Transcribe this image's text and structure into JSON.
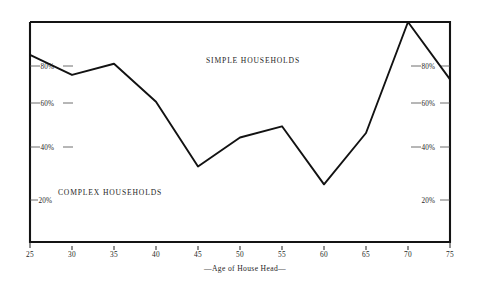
{
  "chart_data": {
    "type": "line",
    "title": "",
    "xlabel": "—Age of House Head—",
    "ylabel": "",
    "x": [
      25,
      30,
      35,
      40,
      45,
      50,
      55,
      60,
      65,
      70,
      75
    ],
    "series": [
      {
        "name": "Simple Households",
        "values": [
          85,
          76,
          81,
          64,
          35,
          48,
          53,
          27,
          50,
          100,
          74
        ]
      }
    ],
    "xlim": [
      25,
      75
    ],
    "ylim": [
      10,
      100
    ],
    "xticks": [
      "25",
      "30",
      "35",
      "40",
      "45",
      "50",
      "55",
      "60",
      "65",
      "70",
      "75"
    ],
    "yticks": [
      "80%",
      "60%",
      "40%",
      "20%"
    ],
    "ytick_values": [
      80,
      60,
      40,
      20
    ],
    "grid": false,
    "legend": "none",
    "annotations": [
      {
        "name": "simple-households",
        "text": "SIMPLE HOUSEHOLDS",
        "x": 51.5,
        "y": 86
      },
      {
        "name": "complex-households",
        "text": "COMPLEX HOUSEHOLDS",
        "x": 31.5,
        "y": 25
      }
    ],
    "line_color": "#121212",
    "frame_color": "#141414",
    "background_color": "#ffffff"
  },
  "axes": {
    "left_tick_labels": [
      "80%",
      "60%",
      "40%",
      "20%"
    ],
    "right_tick_labels": [
      "80%",
      "60%",
      "40%",
      "20%"
    ],
    "bottom_tick_labels": [
      "25",
      "30",
      "35",
      "40",
      "45",
      "50",
      "55",
      "60",
      "65",
      "70",
      "75"
    ],
    "bottom_axis_title": "—Age of House Head—"
  },
  "annotations": {
    "simple_label": "SIMPLE HOUSEHOLDS",
    "complex_label": "COMPLEX HOUSEHOLDS"
  }
}
